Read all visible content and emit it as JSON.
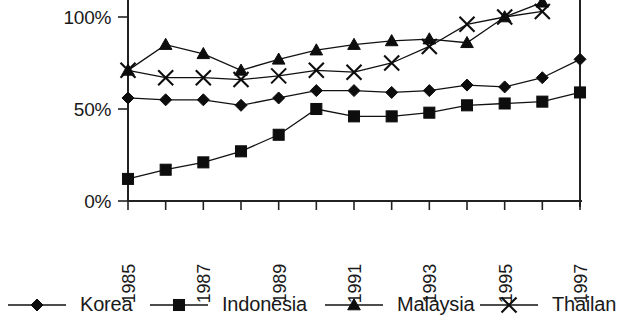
{
  "chart_data": {
    "type": "line",
    "title": "",
    "subtitle": "",
    "xlabel": "",
    "ylabel": "",
    "x": [
      1985,
      1986,
      1987,
      1988,
      1989,
      1990,
      1991,
      1992,
      1993,
      1994,
      1995,
      1996,
      1997
    ],
    "tick_labels_x": [
      "1985",
      "1987",
      "1989",
      "1991",
      "1993",
      "1995",
      "1997"
    ],
    "tick_labels_y": [
      "0%",
      "50%",
      "100%"
    ],
    "tick_values_y": [
      0,
      50,
      100
    ],
    "xlim": [
      1985,
      1997
    ],
    "ylim": [
      0,
      112
    ],
    "grid": false,
    "legend_position": "bottom",
    "units": "percent",
    "series": [
      {
        "name": "Korea",
        "marker": "diamond",
        "values": [
          56,
          55,
          55,
          52,
          56,
          60,
          60,
          59,
          60,
          63,
          62,
          67,
          77
        ]
      },
      {
        "name": "Indonesia",
        "marker": "square",
        "values": [
          12,
          17,
          21,
          27,
          36,
          50,
          46,
          46,
          48,
          52,
          53,
          54,
          59
        ]
      },
      {
        "name": "Malaysia",
        "marker": "triangle",
        "values": [
          71,
          85,
          80,
          71,
          77,
          82,
          85,
          87,
          88,
          86,
          100,
          108,
          null
        ]
      },
      {
        "name": "Thailand",
        "marker": "cross",
        "values": [
          71,
          67,
          67,
          66,
          68,
          71,
          70,
          75,
          84,
          96,
          100,
          103,
          null
        ]
      }
    ]
  },
  "legend": {
    "entries": [
      {
        "label": "Korea",
        "marker": "diamond"
      },
      {
        "label": "Indonesia",
        "marker": "square"
      },
      {
        "label": "Malaysia",
        "marker": "triangle"
      },
      {
        "label": "Thailan",
        "marker": "cross"
      }
    ]
  },
  "colors": {
    "ink": "#111111",
    "axis": "#222222",
    "background": "#ffffff"
  }
}
